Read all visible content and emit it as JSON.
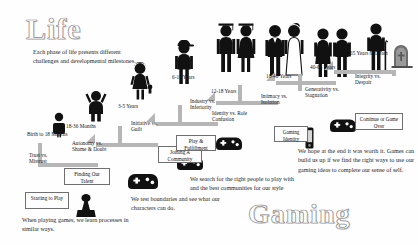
{
  "titles": {
    "left": "Life",
    "right": "Gaming"
  },
  "intro": "Each phase of life presents different challenges and developmental milestones.",
  "captions": {
    "left_bottom": "When playing games, we learn processes in similar ways.",
    "mid_bottom": "We test boundaries and see what our characters can do.",
    "right_mid": "We search for the right people to play with and the best communities for our style",
    "far_right": "We hope at the end it was worth it. Games can build us up if we find the right ways to use our gaming ideas to complete our sense of self."
  },
  "stages": [
    {
      "age": "Birth to 18 Months",
      "crisis": "Trust vs. Mistrust",
      "gaming": "Starting to Play"
    },
    {
      "age": "18-36 Months",
      "crisis": "Autonomy vs. Shame & Doubt",
      "gaming": "Finding Our Talent"
    },
    {
      "age": "3-5 Years",
      "crisis": "Initiative vs. Guilt",
      "gaming": ""
    },
    {
      "age": "6-11 Years",
      "crisis": "Industry vs. Inferiority",
      "gaming": "Joining A Community"
    },
    {
      "age": "12-18 Years",
      "crisis": "Identity vs. Role Confusion",
      "gaming": "Play & Fulfillment"
    },
    {
      "age": "18-40 Years",
      "crisis": "Intimacy vs. Isolation",
      "gaming": "Gaming Identity"
    },
    {
      "age": "40-65 Years",
      "crisis": "Generativity vs. Stagnation",
      "gaming": ""
    },
    {
      "age": "65 Years to Death",
      "crisis": "Integrity vs. Despair",
      "gaming": "Continue or Game Over"
    }
  ],
  "icons": {
    "baby": "baby-figure-icon",
    "toddler": "toddler-figure-icon",
    "child_girl": "child-girl-figure-icon",
    "child_boy": "child-boy-figure-icon",
    "graduates": "graduate-figures-icon",
    "wedding": "wedding-couple-figure-icon",
    "adults": "adult-couple-figure-icon",
    "elder": "elder-with-cane-figure-icon",
    "grave": "gravestone-icon",
    "joystick": "joystick-icon",
    "gamepad": "gamepad-icon",
    "phone": "mobile-phone-icon"
  },
  "colors": {
    "connector": "#b6b6b6",
    "connector_dark": "#9b9b9b",
    "ink": "#111111",
    "box_border": "#6f6f6f"
  }
}
